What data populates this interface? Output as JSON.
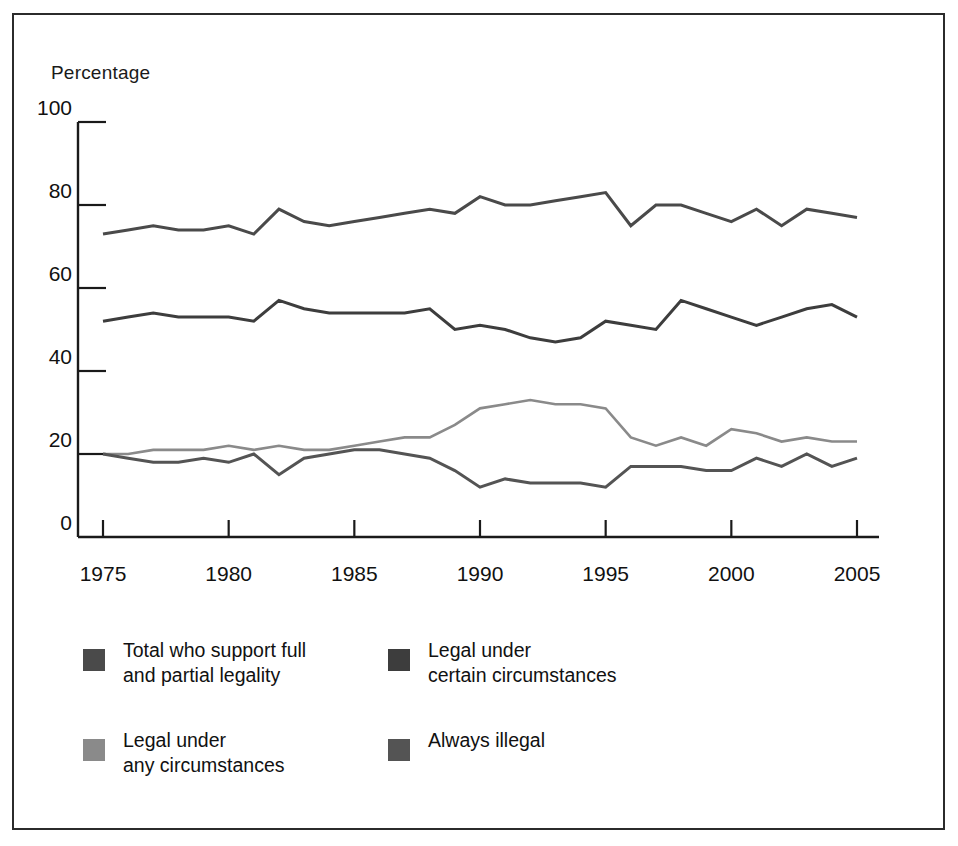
{
  "figure": {
    "axis_title": "Percentage",
    "frame_color": "#2b2b2b"
  },
  "legend": {
    "items": [
      {
        "label": "Total who support full\nand partial legality",
        "color": "#4a4a4a",
        "key": "total"
      },
      {
        "label": "Legal under\ncertain circumstances",
        "color": "#3d3d3d",
        "key": "certain"
      },
      {
        "label": "Legal under\nany circumstances",
        "color": "#8a8a8a",
        "key": "any"
      },
      {
        "label": "Always illegal",
        "color": "#545454",
        "key": "illegal"
      }
    ]
  },
  "chart_data": {
    "type": "line",
    "title": "",
    "subtitle": "",
    "xlabel": "",
    "ylabel": "Percentage",
    "xlim": [
      1975,
      2005
    ],
    "ylim": [
      0,
      100
    ],
    "yticks": [
      0,
      20,
      40,
      60,
      80,
      100
    ],
    "xticks": [
      1975,
      1980,
      1985,
      1990,
      1995,
      2000,
      2005
    ],
    "grid": false,
    "legend_position": "bottom-left",
    "x": [
      1975,
      1976,
      1977,
      1978,
      1979,
      1980,
      1981,
      1982,
      1983,
      1984,
      1985,
      1986,
      1987,
      1988,
      1989,
      1990,
      1991,
      1992,
      1993,
      1994,
      1995,
      1996,
      1997,
      1998,
      1999,
      2000,
      2001,
      2002,
      2003,
      2004,
      2005
    ],
    "series": [
      {
        "name": "Total who support full and partial legality",
        "color": "#4a4a4a",
        "values": [
          73,
          74,
          75,
          74,
          74,
          75,
          73,
          79,
          76,
          75,
          76,
          77,
          78,
          79,
          78,
          82,
          80,
          80,
          81,
          82,
          83,
          75,
          80,
          80,
          78,
          76,
          79,
          75,
          79,
          78,
          77
        ]
      },
      {
        "name": "Legal under certain circumstances",
        "color": "#3d3d3d",
        "values": [
          52,
          53,
          54,
          53,
          53,
          53,
          52,
          57,
          55,
          54,
          54,
          54,
          54,
          55,
          50,
          51,
          50,
          48,
          47,
          48,
          52,
          51,
          50,
          57,
          55,
          53,
          51,
          53,
          55,
          56,
          53
        ]
      },
      {
        "name": "Legal under any circumstances",
        "color": "#8a8a8a",
        "values": [
          20,
          20,
          21,
          21,
          21,
          22,
          21,
          22,
          21,
          21,
          22,
          23,
          24,
          24,
          27,
          31,
          32,
          33,
          32,
          32,
          31,
          24,
          22,
          24,
          22,
          26,
          25,
          23,
          24,
          23,
          23
        ]
      },
      {
        "name": "Always illegal",
        "color": "#545454",
        "values": [
          20,
          19,
          18,
          18,
          19,
          18,
          20,
          15,
          19,
          20,
          21,
          21,
          20,
          19,
          16,
          12,
          14,
          13,
          13,
          13,
          12,
          17,
          17,
          17,
          16,
          16,
          19,
          17,
          20,
          17,
          19
        ]
      }
    ]
  }
}
